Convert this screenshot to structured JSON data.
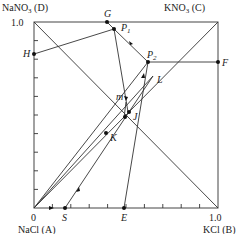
{
  "diagram": {
    "corners": {
      "A": {
        "label": "NaCl (A)",
        "value_label": "0"
      },
      "B": {
        "label": "KCl (B)",
        "value_label": "1.0"
      },
      "C": {
        "label": "KNO3 (C)",
        "label_main": "KNO",
        "label_sub": "3",
        "label_tail": " (C)"
      },
      "D": {
        "label": "NaNO3 (D)",
        "label_main": "NaNO",
        "label_sub": "3",
        "label_tail": " (D)",
        "value_label": "1.0"
      }
    },
    "points": {
      "G": "G",
      "P1": {
        "main": "P",
        "sub": "1"
      },
      "P2": {
        "main": "P",
        "sub": "2"
      },
      "F": "F",
      "H": "H",
      "m": "m",
      "J": "J",
      "K": "K",
      "L": "L",
      "S": "S",
      "E": "E"
    },
    "colors": {
      "line": "#333333",
      "point": "#111111"
    }
  }
}
